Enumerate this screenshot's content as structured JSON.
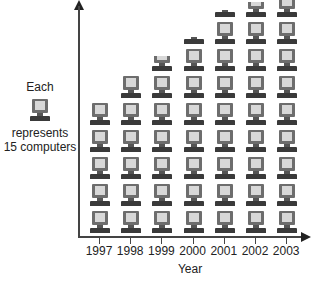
{
  "chart_data": {
    "type": "pictograph",
    "title": "",
    "xlabel": "Year",
    "ylabel": "",
    "categories": [
      "1997",
      "1998",
      "1999",
      "2000",
      "2001",
      "2002",
      "2003"
    ],
    "icon_counts": [
      5,
      6,
      6.67,
      7.33,
      8.33,
      8.67,
      9
    ],
    "values": [
      75,
      90,
      100,
      110,
      125,
      130,
      135
    ],
    "unit_per_icon": 15,
    "legend": {
      "line1": "Each",
      "line2": "represents",
      "line3": "15 computers",
      "icon": "computer-icon"
    },
    "grid": false
  },
  "colors": {
    "axis": "#444444",
    "monitor": "#6d6d6d",
    "screen": "#d8d8d8",
    "keyboard": "#3a3a3a"
  }
}
